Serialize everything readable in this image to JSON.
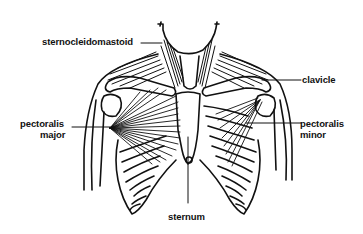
{
  "diagram": {
    "labels": {
      "sternocleidomastoid": "sternocleidomastoid",
      "clavicle": "clavicle",
      "pectoralis_major_line1": "pectoralis",
      "pectoralis_major_line2": "major",
      "pectoralis_minor_line1": "pectoralis",
      "pectoralis_minor_line2": "minor",
      "sternum": "sternum"
    },
    "colors": {
      "ink": "#111111",
      "background": "#ffffff"
    }
  }
}
